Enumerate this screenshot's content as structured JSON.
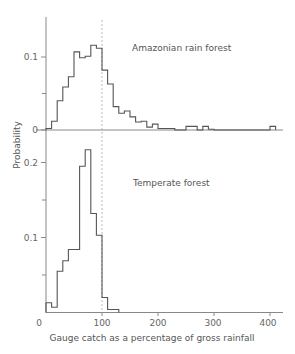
{
  "chart_data": [
    {
      "type": "bar",
      "style": "step-histogram",
      "title": "Amazonian rain forest",
      "xlabel": "Gauge catch as a percentage of gross rainfall",
      "ylabel": "Probability",
      "xlim": [
        0,
        420
      ],
      "ylim": [
        0,
        0.135
      ],
      "yticks": [
        0,
        0.05,
        0.1
      ],
      "ytick_labels": [
        "0",
        "",
        "0.1"
      ],
      "reference_line": {
        "x": 100,
        "style": "dashed"
      },
      "bin_width": 10,
      "bins": [
        {
          "x0": 0,
          "x1": 10,
          "p": 0.002
        },
        {
          "x0": 10,
          "x1": 20,
          "p": 0.012
        },
        {
          "x0": 20,
          "x1": 30,
          "p": 0.04
        },
        {
          "x0": 30,
          "x1": 40,
          "p": 0.059
        },
        {
          "x0": 40,
          "x1": 50,
          "p": 0.073
        },
        {
          "x0": 50,
          "x1": 60,
          "p": 0.107
        },
        {
          "x0": 60,
          "x1": 70,
          "p": 0.099
        },
        {
          "x0": 70,
          "x1": 80,
          "p": 0.101
        },
        {
          "x0": 80,
          "x1": 90,
          "p": 0.116
        },
        {
          "x0": 90,
          "x1": 100,
          "p": 0.112
        },
        {
          "x0": 100,
          "x1": 110,
          "p": 0.082
        },
        {
          "x0": 110,
          "x1": 120,
          "p": 0.063
        },
        {
          "x0": 120,
          "x1": 130,
          "p": 0.032
        },
        {
          "x0": 130,
          "x1": 140,
          "p": 0.023
        },
        {
          "x0": 140,
          "x1": 150,
          "p": 0.026
        },
        {
          "x0": 150,
          "x1": 160,
          "p": 0.018
        },
        {
          "x0": 160,
          "x1": 170,
          "p": 0.011
        },
        {
          "x0": 170,
          "x1": 180,
          "p": 0.012
        },
        {
          "x0": 180,
          "x1": 190,
          "p": 0.004
        },
        {
          "x0": 190,
          "x1": 200,
          "p": 0.008
        },
        {
          "x0": 200,
          "x1": 230,
          "p": 0.002
        },
        {
          "x0": 230,
          "x1": 250,
          "p": 0.0
        },
        {
          "x0": 250,
          "x1": 270,
          "p": 0.005
        },
        {
          "x0": 270,
          "x1": 280,
          "p": 0.0
        },
        {
          "x0": 280,
          "x1": 290,
          "p": 0.005
        },
        {
          "x0": 290,
          "x1": 300,
          "p": 0.001
        },
        {
          "x0": 300,
          "x1": 400,
          "p": 0.0
        },
        {
          "x0": 400,
          "x1": 410,
          "p": 0.005
        }
      ]
    },
    {
      "type": "bar",
      "style": "step-histogram",
      "title": "Temperate forest",
      "xlabel": "Gauge catch as a percentage of gross rainfall",
      "ylabel": "Probability",
      "xlim": [
        0,
        420
      ],
      "ylim": [
        0,
        0.235
      ],
      "xticks": [
        0,
        100,
        200,
        300,
        400
      ],
      "xtick_labels": [
        "0",
        "100",
        "200",
        "300",
        "400"
      ],
      "yticks": [
        0.05,
        0.1,
        0.15,
        0.2
      ],
      "ytick_labels": [
        "",
        "0.1",
        "",
        "0.2"
      ],
      "reference_line": {
        "x": 100,
        "style": "dashed"
      },
      "bin_width": 10,
      "bins": [
        {
          "x0": 0,
          "x1": 10,
          "p": 0.013
        },
        {
          "x0": 10,
          "x1": 20,
          "p": 0.007
        },
        {
          "x0": 20,
          "x1": 30,
          "p": 0.055
        },
        {
          "x0": 30,
          "x1": 40,
          "p": 0.069
        },
        {
          "x0": 40,
          "x1": 50,
          "p": 0.084
        },
        {
          "x0": 50,
          "x1": 60,
          "p": 0.084
        },
        {
          "x0": 60,
          "x1": 70,
          "p": 0.195
        },
        {
          "x0": 70,
          "x1": 80,
          "p": 0.217
        },
        {
          "x0": 80,
          "x1": 90,
          "p": 0.132
        },
        {
          "x0": 90,
          "x1": 100,
          "p": 0.103
        },
        {
          "x0": 100,
          "x1": 110,
          "p": 0.02
        },
        {
          "x0": 110,
          "x1": 120,
          "p": 0.004
        },
        {
          "x0": 120,
          "x1": 130,
          "p": 0.004
        }
      ]
    }
  ],
  "labels": {
    "top_panel": "Amazonian rain forest",
    "bottom_panel": "Temperate forest",
    "ylabel": "Probability",
    "xlabel": "Gauge catch as a percentage of gross rainfall",
    "top_yticks": [
      "0",
      "0.1"
    ],
    "bottom_yticks": [
      "0.1",
      "0.2"
    ],
    "xticks": [
      "0",
      "100",
      "200",
      "300",
      "400"
    ]
  },
  "colors": {
    "line": "#555555",
    "axis": "#888888",
    "reference": "#999999"
  }
}
